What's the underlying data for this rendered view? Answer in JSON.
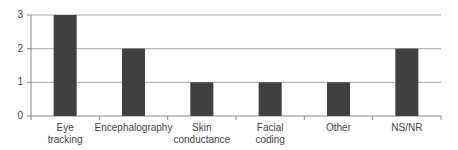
{
  "chart_data": {
    "type": "bar",
    "title": "",
    "xlabel": "",
    "ylabel": "",
    "categories": [
      "Eye tracking",
      "Encephalography",
      "Skin conductance",
      "Facial coding",
      "Other",
      "NS/NR"
    ],
    "category_lines": [
      [
        "Eye",
        "tracking"
      ],
      [
        "Encephalography"
      ],
      [
        "Skin",
        "conductance"
      ],
      [
        "Facial",
        "coding"
      ],
      [
        "Other"
      ],
      [
        "NS/NR"
      ]
    ],
    "values": [
      3,
      2,
      1,
      1,
      1,
      2
    ],
    "ylim": [
      0,
      3
    ],
    "yticks": [
      0,
      1,
      2,
      3
    ],
    "grid": true,
    "legend": null,
    "colors": {
      "bar": "#404040",
      "grid": "#a6a6a6",
      "axis": "#888888"
    }
  }
}
